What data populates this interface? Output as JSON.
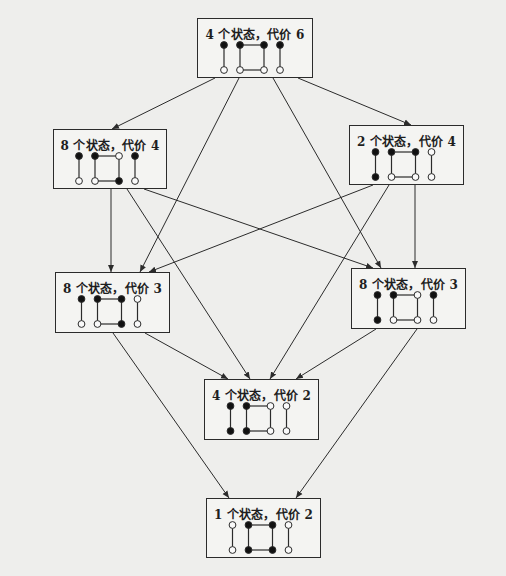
{
  "diagram": {
    "type": "lattice",
    "description_colors": {
      "line": "#2b2b2b",
      "background": "#eeeeec",
      "box_fill": "#f4f4f2"
    },
    "nodes": [
      {
        "id": "n1",
        "label": "4 个状态，代价 6",
        "x": 197,
        "y": 18,
        "w": 116,
        "h": 60,
        "left_edge": [
          "filled",
          "open"
        ],
        "square": [
          "filled",
          "open",
          "open",
          "filled"
        ],
        "right_edge": [
          "filled",
          "open"
        ]
      },
      {
        "id": "n2",
        "label": "8 个状态，代价 4",
        "x": 53,
        "y": 129,
        "w": 114,
        "h": 60,
        "left_edge": [
          "filled",
          "open"
        ],
        "square": [
          "filled",
          "open",
          "filled",
          "open"
        ],
        "right_edge": [
          "filled",
          "open"
        ]
      },
      {
        "id": "n3",
        "label": "2 个状态，代价 4",
        "x": 349,
        "y": 125,
        "w": 115,
        "h": 60,
        "left_edge": [
          "filled",
          "filled"
        ],
        "square": [
          "filled",
          "open",
          "open",
          "filled"
        ],
        "right_edge": [
          "open",
          "open"
        ]
      },
      {
        "id": "n4",
        "label": "8 个状态，代价 3",
        "x": 55,
        "y": 272,
        "w": 115,
        "h": 61,
        "left_edge": [
          "filled",
          "open"
        ],
        "square": [
          "filled",
          "open",
          "filled",
          "filled"
        ],
        "right_edge": [
          "open",
          "open"
        ]
      },
      {
        "id": "n5",
        "label": "8 个状态，代价 3",
        "x": 351,
        "y": 268,
        "w": 115,
        "h": 61,
        "left_edge": [
          "filled",
          "filled"
        ],
        "square": [
          "filled",
          "open",
          "open",
          "open"
        ],
        "right_edge": [
          "filled",
          "open"
        ]
      },
      {
        "id": "n6",
        "label": "4 个状态，代价 2",
        "x": 204,
        "y": 379,
        "w": 115,
        "h": 61,
        "left_edge": [
          "filled",
          "filled"
        ],
        "square": [
          "filled",
          "filled",
          "open",
          "open"
        ],
        "right_edge": [
          "open",
          "open"
        ]
      },
      {
        "id": "n7",
        "label": "1 个状态，代价 2",
        "x": 206,
        "y": 498,
        "w": 115,
        "h": 60,
        "left_edge": [
          "open",
          "open"
        ],
        "square": [
          "filled",
          "filled",
          "filled",
          "filled"
        ],
        "right_edge": [
          "open",
          "open"
        ]
      }
    ],
    "edges": [
      {
        "from": "n1",
        "to": "n2",
        "x1": 215,
        "y1": 78,
        "x2": 112,
        "y2": 129
      },
      {
        "from": "n1",
        "to": "n3",
        "x1": 298,
        "y1": 78,
        "x2": 411,
        "y2": 125
      },
      {
        "from": "n1",
        "to": "n4",
        "x1": 239,
        "y1": 78,
        "x2": 140,
        "y2": 272
      },
      {
        "from": "n1",
        "to": "n5",
        "x1": 273,
        "y1": 78,
        "x2": 381,
        "y2": 268
      },
      {
        "from": "n2",
        "to": "n4",
        "x1": 111,
        "y1": 189,
        "x2": 111,
        "y2": 272
      },
      {
        "from": "n2",
        "to": "n5",
        "x1": 144,
        "y1": 189,
        "x2": 373,
        "y2": 268
      },
      {
        "from": "n2",
        "to": "n6",
        "x1": 127,
        "y1": 189,
        "x2": 250,
        "y2": 379
      },
      {
        "from": "n3",
        "to": "n4",
        "x1": 373,
        "y1": 185,
        "x2": 149,
        "y2": 272
      },
      {
        "from": "n3",
        "to": "n5",
        "x1": 415,
        "y1": 185,
        "x2": 415,
        "y2": 268
      },
      {
        "from": "n3",
        "to": "n6",
        "x1": 389,
        "y1": 185,
        "x2": 270,
        "y2": 379
      },
      {
        "from": "n4",
        "to": "n6",
        "x1": 145,
        "y1": 333,
        "x2": 228,
        "y2": 379
      },
      {
        "from": "n4",
        "to": "n7",
        "x1": 113,
        "y1": 333,
        "x2": 229,
        "y2": 498
      },
      {
        "from": "n5",
        "to": "n6",
        "x1": 376,
        "y1": 329,
        "x2": 296,
        "y2": 379
      },
      {
        "from": "n5",
        "to": "n7",
        "x1": 417,
        "y1": 329,
        "x2": 296,
        "y2": 498
      }
    ]
  }
}
